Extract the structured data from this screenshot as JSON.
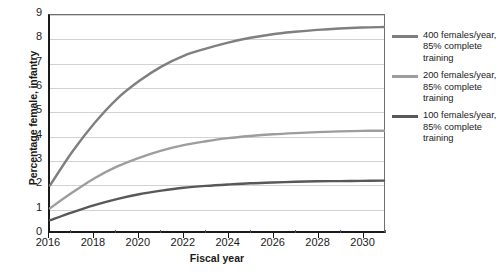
{
  "chart_data": {
    "type": "line",
    "title": "",
    "xlabel": "Fiscal year",
    "ylabel": "Percentage female, infantry",
    "xlim": [
      2016,
      2031
    ],
    "ylim": [
      0,
      9
    ],
    "yticks": [
      0,
      1,
      2,
      3,
      4,
      5,
      6,
      7,
      8,
      9
    ],
    "xticks": [
      2016,
      2018,
      2020,
      2022,
      2024,
      2026,
      2028,
      2030
    ],
    "xticks_minor": [
      2017,
      2019,
      2021,
      2023,
      2025,
      2027,
      2029,
      2031
    ],
    "grid": "horizontal",
    "legend_position": "right",
    "x": [
      2016,
      2017,
      2018,
      2019,
      2020,
      2021,
      2022,
      2023,
      2024,
      2025,
      2026,
      2027,
      2028,
      2029,
      2030,
      2031
    ],
    "series": [
      {
        "name": "400 females/year, 85% complete training",
        "color": "#7f7f7f",
        "width": 2.4,
        "values": [
          1.9,
          3.3,
          4.5,
          5.5,
          6.25,
          6.85,
          7.3,
          7.6,
          7.85,
          8.05,
          8.2,
          8.3,
          8.38,
          8.44,
          8.48,
          8.5
        ]
      },
      {
        "name": "200 females/year, 85% complete training",
        "color": "#9d9d9d",
        "width": 2.4,
        "values": [
          0.95,
          1.6,
          2.2,
          2.68,
          3.05,
          3.35,
          3.58,
          3.74,
          3.87,
          3.96,
          4.03,
          4.08,
          4.12,
          4.15,
          4.17,
          4.18
        ]
      },
      {
        "name": "100 females/year, 85% complete training",
        "color": "#585858",
        "width": 2.4,
        "values": [
          0.45,
          0.78,
          1.08,
          1.33,
          1.53,
          1.68,
          1.8,
          1.88,
          1.94,
          1.99,
          2.02,
          2.05,
          2.07,
          2.08,
          2.09,
          2.1
        ]
      }
    ]
  },
  "legend": {
    "items": [
      {
        "label": "400 females/year, 85% complete training",
        "color": "#7f7f7f"
      },
      {
        "label": "200 females/year, 85% complete training",
        "color": "#9d9d9d"
      },
      {
        "label": "100 females/year, 85% complete training",
        "color": "#585858"
      }
    ]
  },
  "axes": {
    "x_title": "Fiscal year",
    "y_title": "Percentage female, infantry"
  }
}
